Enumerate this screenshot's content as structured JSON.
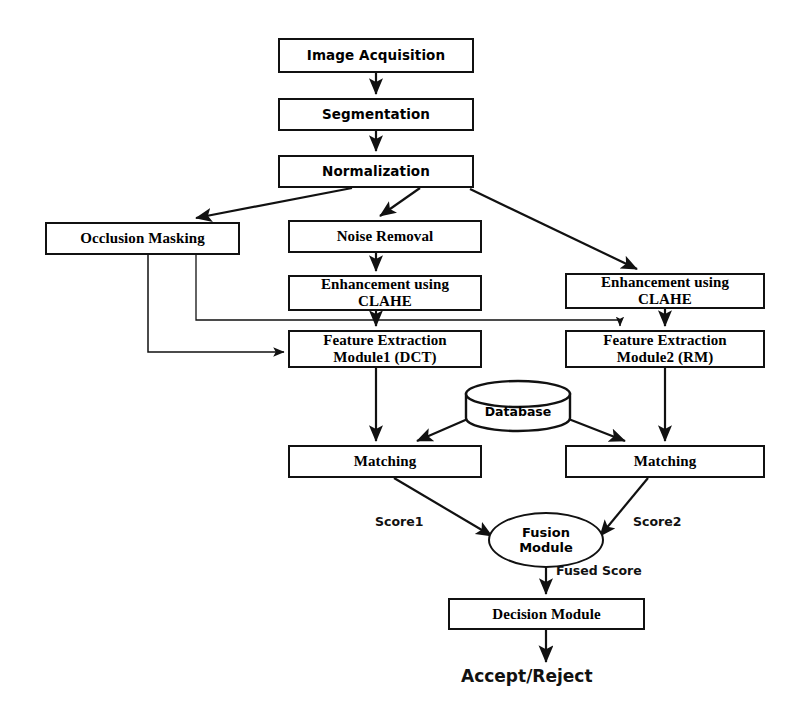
{
  "diagram": {
    "nodes": {
      "image_acquisition": "Image Acquisition",
      "segmentation": "Segmentation",
      "normalization": "Normalization",
      "occlusion_masking": "Occlusion Masking",
      "noise_removal": "Noise Removal",
      "enhancement_left_line1": "Enhancement using",
      "enhancement_left_line2": "CLAHE",
      "enhancement_right_line1": "Enhancement using",
      "enhancement_right_line2": "CLAHE",
      "feature_extraction_1_line1": "Feature Extraction",
      "feature_extraction_1_line2": "Module1 (DCT)",
      "feature_extraction_2_line1": "Feature Extraction",
      "feature_extraction_2_line2": "Module2 (RM)",
      "matching_left": "Matching",
      "matching_right": "Matching",
      "database": "Database",
      "fusion_module_line1": "Fusion",
      "fusion_module_line2": "Module",
      "decision_module": "Decision Module",
      "accept_reject": "Accept/Reject"
    },
    "edge_labels": {
      "score1": "Score1",
      "score2": "Score2",
      "fused_score": "Fused Score"
    },
    "colors": {
      "stroke": "#111111",
      "fill": "#ffffff",
      "text": "#000000"
    }
  }
}
